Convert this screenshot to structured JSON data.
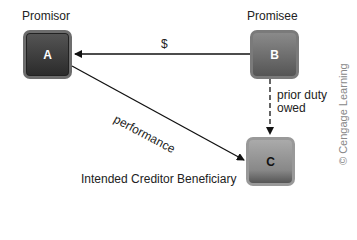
{
  "diagram": {
    "nodes": [
      {
        "id": "A",
        "label": "A",
        "role": "Promisor"
      },
      {
        "id": "B",
        "label": "B",
        "role": "Promisee"
      },
      {
        "id": "C",
        "label": "C",
        "role": "Intended Creditor Beneficiary"
      }
    ],
    "edges": [
      {
        "from": "B",
        "to": "A",
        "label": "$",
        "style": "solid"
      },
      {
        "from": "A",
        "to": "C",
        "label": "performance",
        "style": "solid"
      },
      {
        "from": "B",
        "to": "C",
        "label_line1": "prior duty",
        "label_line2": "owed",
        "style": "dashed"
      }
    ],
    "credit": "© Cengage Learning"
  }
}
